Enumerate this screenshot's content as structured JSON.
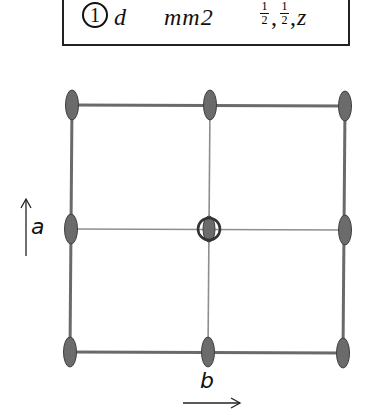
{
  "header": {
    "multiplicity_marker": "1",
    "wyckoff_letter": "d",
    "site_symmetry": "mm2",
    "coordinates": {
      "x_num": "1",
      "x_den": "2",
      "sep1": ",",
      "y_num": "1",
      "y_den": "2",
      "sep2": ",",
      "z": "z"
    }
  },
  "diagram": {
    "axis_a_label": "a",
    "axis_b_label": "b",
    "line_color_outer": "#666666",
    "line_color_inner": "#8a8a8a",
    "node_fill": "#6b6b6b",
    "node_stroke": "#3a3a3a",
    "grid": {
      "rows_y": [
        105,
        229,
        352
      ],
      "cols_x": [
        71,
        209,
        345
      ]
    },
    "center_marker": "two-fold-axis-circle"
  }
}
